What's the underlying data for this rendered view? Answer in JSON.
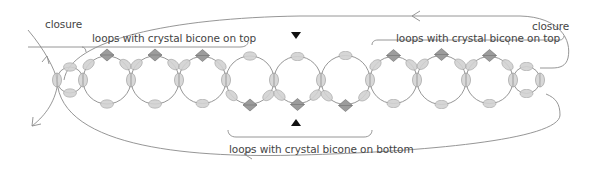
{
  "labels": {
    "closure_left": "closure",
    "closure_right": "closure",
    "top_left": "loops with crystal bicone on top",
    "top_right": "loops with crystal bicone on top",
    "bottom": "loops with crystal bicone on bottom"
  },
  "colors": {
    "thread": "#8a8a8a",
    "seed_bead_fill": "#d2d2d2",
    "seed_bead_stroke": "#9a9a9a",
    "bicone_fill": "#9c9c9c",
    "bicone_stroke": "#6a6a6a",
    "marker": "#111111",
    "text": "#444444"
  },
  "diagram": {
    "connector_x": [
      57,
      83,
      131,
      179,
      226,
      274,
      321,
      370,
      417,
      466,
      513,
      540
    ],
    "loop_center_y": 80,
    "loops": [
      {
        "from": 57,
        "to": 83,
        "type": "small"
      },
      {
        "from": 83,
        "to": 131,
        "type": "bicone-top"
      },
      {
        "from": 131,
        "to": 179,
        "type": "bicone-top"
      },
      {
        "from": 179,
        "to": 226,
        "type": "bicone-top"
      },
      {
        "from": 226,
        "to": 274,
        "type": "bicone-bottom"
      },
      {
        "from": 274,
        "to": 321,
        "type": "bicone-bottom"
      },
      {
        "from": 321,
        "to": 370,
        "type": "bicone-bottom"
      },
      {
        "from": 370,
        "to": 417,
        "type": "bicone-top"
      },
      {
        "from": 417,
        "to": 466,
        "type": "bicone-top"
      },
      {
        "from": 466,
        "to": 513,
        "type": "bicone-top"
      },
      {
        "from": 513,
        "to": 540,
        "type": "small"
      }
    ],
    "markers": [
      {
        "x": 296,
        "y": 36,
        "dir": "down"
      },
      {
        "x": 296,
        "y": 122,
        "dir": "up"
      }
    ]
  }
}
